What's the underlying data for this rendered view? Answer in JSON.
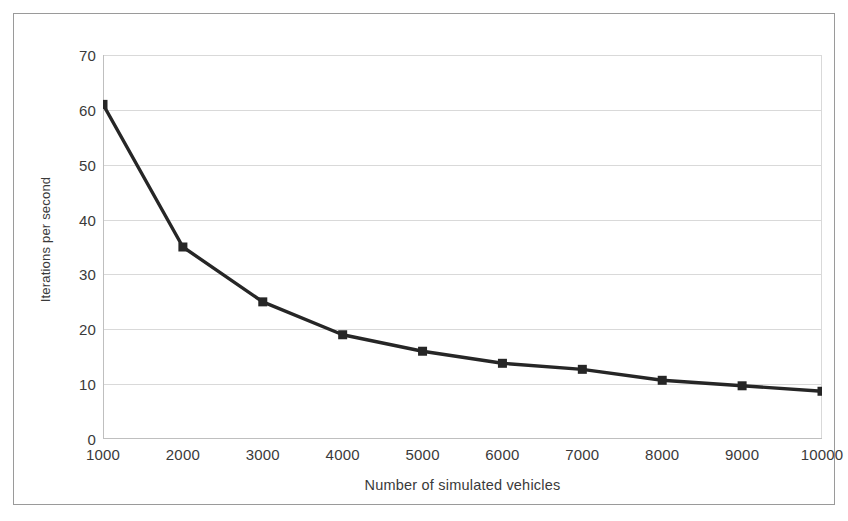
{
  "chart_data": {
    "type": "line",
    "title": "",
    "subtitle": "",
    "xlabel": "Number of simulated vehicles",
    "ylabel": "Iterations per second",
    "x": [
      1000,
      2000,
      3000,
      4000,
      5000,
      6000,
      7000,
      8000,
      9000,
      10000
    ],
    "values": [
      61,
      35,
      25,
      19,
      16,
      13.8,
      12.7,
      10.7,
      9.7,
      8.7
    ],
    "series": [
      {
        "name": "Iterations per second",
        "values": [
          61,
          35,
          25,
          19,
          16,
          13.8,
          12.7,
          10.7,
          9.7,
          8.7
        ]
      }
    ],
    "xlim": [
      1000,
      10000
    ],
    "ylim": [
      0,
      70
    ],
    "x_ticks": [
      "1000",
      "2000",
      "3000",
      "4000",
      "5000",
      "6000",
      "7000",
      "8000",
      "9000",
      "10000"
    ],
    "y_ticks": [
      "0",
      "10",
      "20",
      "30",
      "40",
      "50",
      "60",
      "70"
    ],
    "grid": "horizontal",
    "legend": "none",
    "marker": "square",
    "line_color": "#262626",
    "marker_color": "#262626",
    "grid_color": "#d9d9d9",
    "axis_color": "#bfbfbf",
    "frame_color": "#9a9a9a",
    "background": "#ffffff",
    "annotations": []
  }
}
